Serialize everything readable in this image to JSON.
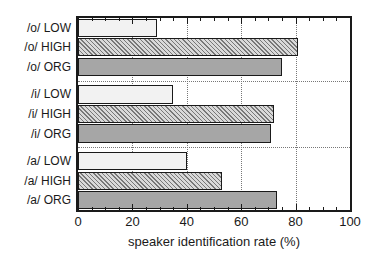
{
  "chart_data": {
    "type": "bar",
    "orientation": "horizontal",
    "title": "",
    "xlabel": "speaker identification rate (%)",
    "ylabel": "",
    "xlim": [
      0,
      100
    ],
    "xticks": [
      0,
      20,
      40,
      60,
      80,
      100
    ],
    "xtick_labels": [
      "0",
      "20",
      "40",
      "60",
      "80",
      "100"
    ],
    "minor_tick_step": 5,
    "grid": "vertical-dotted",
    "legend": "none",
    "categories": [
      "/a/ ORG",
      "/a/ HIGH",
      "/a/ LOW",
      "/i/ ORG",
      "/i/ HIGH",
      "/i/ LOW",
      "/o/ ORG",
      "/o/ HIGH",
      "/o/ LOW"
    ],
    "values": [
      73,
      53,
      40,
      71,
      72,
      35,
      75,
      81,
      29
    ],
    "bars": [
      {
        "label": "/o/ LOW",
        "value": 29,
        "style": "low",
        "group": "/o/",
        "condition": "LOW"
      },
      {
        "label": "/o/ HIGH",
        "value": 81,
        "style": "high",
        "group": "/o/",
        "condition": "HIGH"
      },
      {
        "label": "/o/ ORG",
        "value": 75,
        "style": "org",
        "group": "/o/",
        "condition": "ORG"
      },
      {
        "label": "/i/ LOW",
        "value": 35,
        "style": "low",
        "group": "/i/",
        "condition": "LOW"
      },
      {
        "label": "/i/ HIGH",
        "value": 72,
        "style": "high",
        "group": "/i/",
        "condition": "HIGH"
      },
      {
        "label": "/i/ ORG",
        "value": 71,
        "style": "org",
        "group": "/i/",
        "condition": "ORG"
      },
      {
        "label": "/a/ LOW",
        "value": 40,
        "style": "low",
        "group": "/a/",
        "condition": "LOW"
      },
      {
        "label": "/a/ HIGH",
        "value": 53,
        "style": "high",
        "group": "/a/",
        "condition": "HIGH"
      },
      {
        "label": "/a/ ORG",
        "value": 73,
        "style": "org",
        "group": "/a/",
        "condition": "ORG"
      }
    ],
    "groups": [
      "/o/",
      "/i/",
      "/a/"
    ],
    "colors": {
      "axis": "#1a1a1a",
      "grid": "#777777",
      "bar_low": "#f2f2f2",
      "bar_high": "#d9d9d9",
      "bar_org": "#a6a6a6",
      "background": "#ffffff"
    }
  }
}
